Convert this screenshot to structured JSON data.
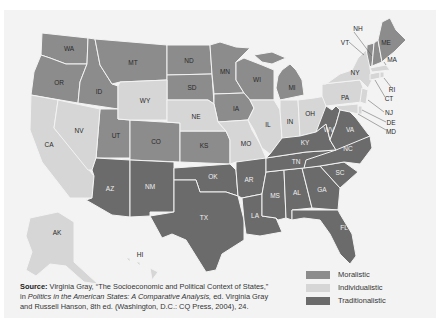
{
  "map": {
    "title": "Political cultures of the American states",
    "categories": [
      {
        "key": "moralistic",
        "label": "Moralistic",
        "color": "#8c8c8c"
      },
      {
        "key": "individualistic",
        "label": "Individualistic",
        "color": "#d6d6d6"
      },
      {
        "key": "traditionalistic",
        "label": "Traditionalistic",
        "color": "#6b6b6b"
      }
    ],
    "states": {
      "WA": "Moralistic",
      "OR": "Moralistic",
      "ID": "Moralistic",
      "MT": "Moralistic",
      "ND": "Moralistic",
      "SD": "Moralistic",
      "MN": "Moralistic",
      "WI": "Moralistic",
      "MI": "Moralistic",
      "IA": "Moralistic",
      "UT": "Moralistic",
      "CO": "Moralistic",
      "KS": "Moralistic",
      "VT": "Moralistic",
      "NH": "Moralistic",
      "ME": "Moralistic",
      "CA": "Individualistic",
      "NV": "Individualistic",
      "WY": "Individualistic",
      "NE": "Individualistic",
      "MO": "Individualistic",
      "IL": "Individualistic",
      "IN": "Individualistic",
      "OH": "Individualistic",
      "PA": "Individualistic",
      "NY": "Individualistic",
      "NJ": "Individualistic",
      "DE": "Individualistic",
      "MD": "Individualistic",
      "MA": "Individualistic",
      "RI": "Individualistic",
      "CT": "Individualistic",
      "AK": "Individualistic",
      "HI": "Individualistic",
      "AZ": "Traditionalistic",
      "NM": "Traditionalistic",
      "OK": "Traditionalistic",
      "TX": "Traditionalistic",
      "AR": "Traditionalistic",
      "LA": "Traditionalistic",
      "MS": "Traditionalistic",
      "AL": "Traditionalistic",
      "GA": "Traditionalistic",
      "FL": "Traditionalistic",
      "SC": "Traditionalistic",
      "NC": "Traditionalistic",
      "TN": "Traditionalistic",
      "KY": "Traditionalistic",
      "WV": "Traditionalistic",
      "VA": "Traditionalistic"
    },
    "labels": {
      "WA": "WA",
      "OR": "OR",
      "ID": "ID",
      "MT": "MT",
      "ND": "ND",
      "SD": "SD",
      "MN": "MN",
      "WI": "WI",
      "MI": "MI",
      "IA": "IA",
      "UT": "UT",
      "CO": "CO",
      "KS": "KS",
      "VT": "VT",
      "NH": "NH",
      "ME": "ME",
      "CA": "CA",
      "NV": "NV",
      "WY": "WY",
      "NE": "NE",
      "MO": "MO",
      "IL": "IL",
      "IN": "IN",
      "OH": "OH",
      "PA": "PA",
      "NY": "NY",
      "NJ": "NJ",
      "DE": "DE",
      "MD": "MD",
      "MA": "MA",
      "RI": "RI",
      "CT": "CT",
      "AK": "AK",
      "HI": "HI",
      "AZ": "AZ",
      "NM": "NM",
      "OK": "OK",
      "TX": "TX",
      "AR": "AR",
      "LA": "LA",
      "MS": "MS",
      "AL": "AL",
      "GA": "GA",
      "FL": "FL",
      "SC": "SC",
      "NC": "NC",
      "TN": "TN",
      "KY": "KY",
      "WV": "WV",
      "VA": "VA"
    }
  },
  "legend": {
    "items": [
      {
        "label": "Moralistic",
        "color": "#8c8c8c"
      },
      {
        "label": "Individualistic",
        "color": "#d6d6d6"
      },
      {
        "label": "Traditionalistic",
        "color": "#6b6b6b"
      }
    ]
  },
  "source": {
    "label": "Source:",
    "line1": " Virginia Gray, “The Socioeconomic and Political Context of States,”",
    "line2_prefix": "in ",
    "line2_italic": "Politics in the American States: A Comparative Analysis,",
    "line2_suffix": " ed. Virginia Gray",
    "line3": "and Russell Hanson, 8th ed. (Washington, D.C.: CQ Press, 2004), 24."
  }
}
